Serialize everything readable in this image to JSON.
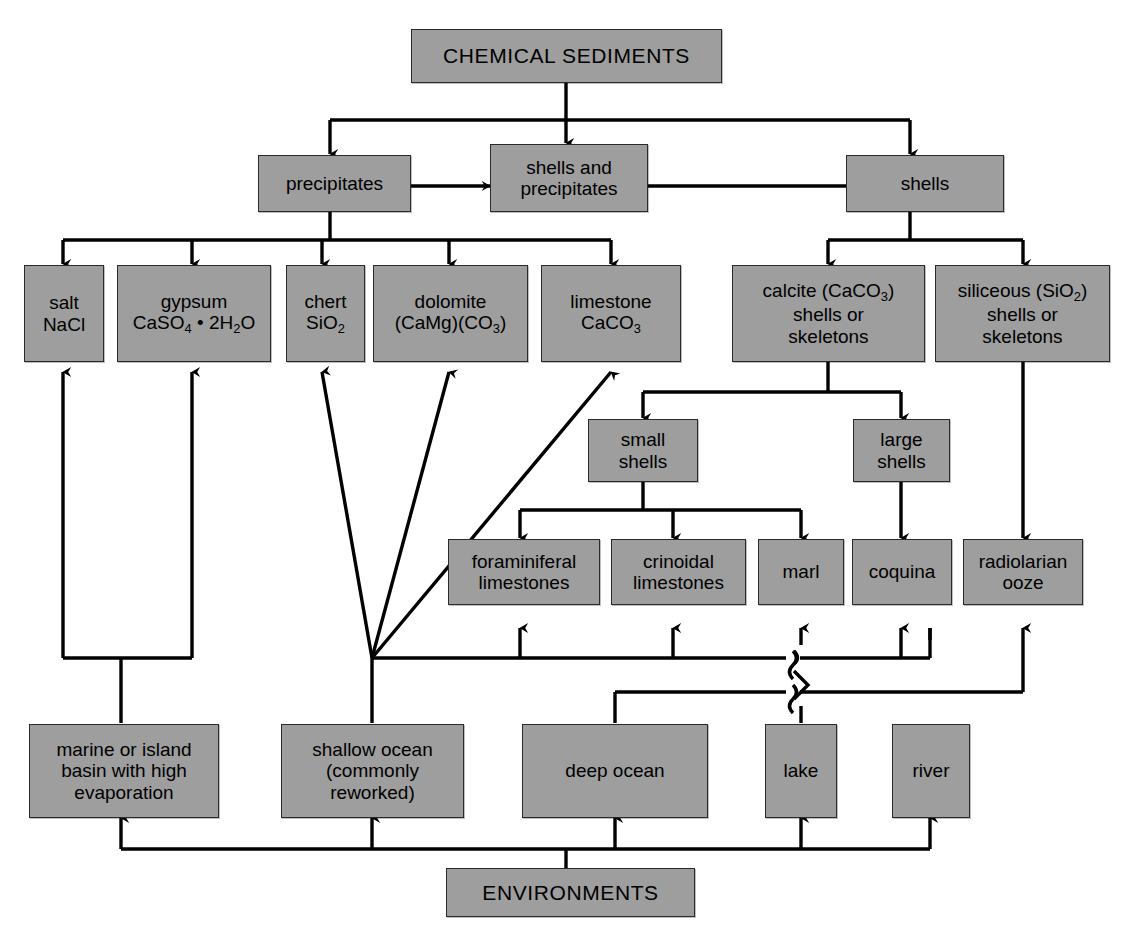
{
  "diagram": {
    "title": "CHEMICAL SEDIMENTS",
    "footer": "ENVIRONMENTS",
    "fill_color": "#9e9e9e",
    "line_color": "#000000",
    "nodes": {
      "chemical_sediments": "CHEMICAL SEDIMENTS",
      "precipitates": "precipitates",
      "shells_and_precipitates": "shells and\nprecipitates",
      "shells": "shells",
      "salt": "salt\nNaCl",
      "gypsum_line1": "gypsum",
      "gypsum_line2_a": "CaSO",
      "gypsum_line2_sub1": "4",
      "gypsum_line2_b": " • 2H",
      "gypsum_line2_sub2": "2",
      "gypsum_line2_c": "O",
      "chert_line1": "chert",
      "chert_line2_a": "SiO",
      "chert_line2_sub": "2",
      "dolomite_line1": "dolomite",
      "dolomite_line2_a": "(CaMg)(CO",
      "dolomite_line2_sub": "3",
      "dolomite_line2_b": ")",
      "limestone_line1": "limestone",
      "limestone_line2_a": "CaCO",
      "limestone_line2_sub": "3",
      "calcite_line1_a": "calcite (CaCO",
      "calcite_line1_sub": "3",
      "calcite_line1_b": ")",
      "calcite_line2": "shells or",
      "calcite_line3": "skeletons",
      "siliceous_line1_a": "siliceous (SiO",
      "siliceous_line1_sub": "2",
      "siliceous_line1_b": ")",
      "siliceous_line2": "shells or",
      "siliceous_line3": "skeletons",
      "small_shells": "small\nshells",
      "large_shells": "large\nshells",
      "foraminiferal_limestones": "foraminiferal\nlimestones",
      "crinoidal_limestones": "crinoidal\nlimestones",
      "marl": "marl",
      "coquina": "coquina",
      "radiolarian_ooze": "radiolarian\nooze",
      "marine_basin": "marine or island\nbasin with high\nevaporation",
      "shallow_ocean": "shallow ocean\n(commonly\nreworked)",
      "deep_ocean": "deep ocean",
      "lake": "lake",
      "river": "river",
      "environments": "ENVIRONMENTS"
    }
  }
}
